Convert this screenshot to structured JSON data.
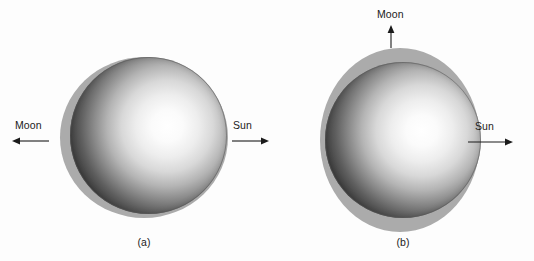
{
  "figure": {
    "type": "scientific-diagram",
    "background_color": "#fdfdfd",
    "bulge_color": "#ababab",
    "body_dark_color": "#1a1a1a",
    "body_light_color": "#ffffff",
    "label_color": "#1b1b1b"
  },
  "panels": [
    {
      "id": "a",
      "caption": "(a)",
      "bulge_orientation": "horizontal",
      "labels": {
        "moon": "Moon",
        "sun": "Sun"
      },
      "arrows": {
        "moon_direction": "left",
        "sun_direction": "right"
      }
    },
    {
      "id": "b",
      "caption": "(b)",
      "bulge_orientation": "vertical",
      "labels": {
        "moon": "Moon",
        "sun": "Sun"
      },
      "arrows": {
        "moon_direction": "up",
        "sun_direction": "right"
      }
    }
  ]
}
